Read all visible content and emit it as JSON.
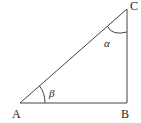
{
  "diagram": {
    "type": "right-triangle",
    "vertices": {
      "A": {
        "label": "A",
        "x": 20,
        "y": 103
      },
      "B": {
        "label": "B",
        "x": 127,
        "y": 103
      },
      "C": {
        "label": "C",
        "x": 127,
        "y": 9
      }
    },
    "angles": {
      "at_C": {
        "label": "α"
      },
      "at_A": {
        "label": "β"
      }
    },
    "right_angle_at": "B",
    "colors": {
      "stroke": "#444444",
      "text": "#222222",
      "background": "#ffffff"
    }
  }
}
